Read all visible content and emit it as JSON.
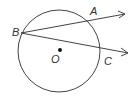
{
  "diagram": {
    "type": "geometry",
    "colors": {
      "stroke": "#444444",
      "text": "#333333",
      "background": "#ffffff"
    },
    "circle": {
      "center_label": "O",
      "cx": 59,
      "cy": 51,
      "r": 41
    },
    "points": [
      {
        "id": "B",
        "label": "B",
        "x": 21,
        "y": 33,
        "label_x": 12,
        "label_y": 36
      },
      {
        "id": "A",
        "label": "A",
        "x": 90,
        "y": 20,
        "label_x": 90,
        "label_y": 15
      },
      {
        "id": "C",
        "label": "C",
        "x": 101,
        "y": 49,
        "label_x": 104,
        "label_y": 65
      },
      {
        "id": "O",
        "label": "O",
        "x": 60,
        "y": 50,
        "label_x": 51,
        "label_y": 63
      }
    ],
    "rays": [
      {
        "from": "B",
        "through": "A",
        "end_x": 125,
        "end_y": 14
      },
      {
        "from": "B",
        "through": "C",
        "end_x": 128,
        "end_y": 53
      }
    ]
  }
}
